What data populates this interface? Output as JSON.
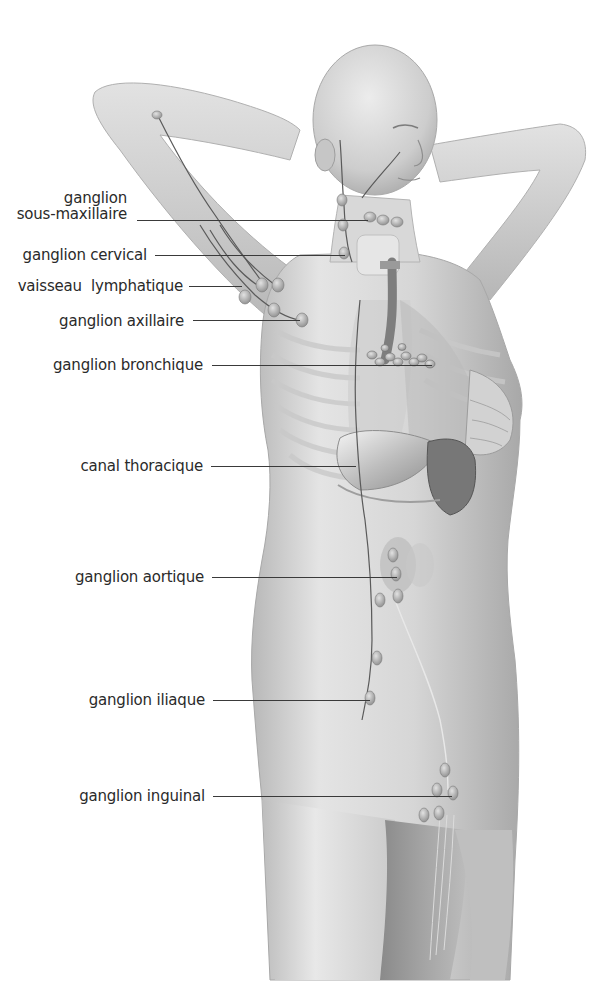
{
  "diagram": {
    "language": "fr",
    "labels": [
      {
        "id": "sous-maxillaire",
        "line1": "ganglion",
        "line2": "sous-maxillaire",
        "text_right": 127,
        "text_top": 190,
        "line_y": 220,
        "line_x1": 137,
        "line_x2": 368
      },
      {
        "id": "cervical",
        "line1": "ganglion cervical",
        "line2": "",
        "text_right": 147,
        "text_top": 247,
        "line_y": 255,
        "line_x1": 155,
        "line_x2": 345
      },
      {
        "id": "vaisseau",
        "line1": "vaisseau  lymphatique",
        "line2": "",
        "text_right": 183,
        "text_top": 278,
        "line_y": 286,
        "line_x1": 189,
        "line_x2": 242
      },
      {
        "id": "axillaire",
        "line1": "ganglion axillaire",
        "line2": "",
        "text_right": 184,
        "text_top": 313,
        "line_y": 320,
        "line_x1": 193,
        "line_x2": 300
      },
      {
        "id": "bronchique",
        "line1": "ganglion bronchique",
        "line2": "",
        "text_right": 203,
        "text_top": 357,
        "line_y": 365,
        "line_x1": 212,
        "line_x2": 432
      },
      {
        "id": "thoracique",
        "line1": "canal thoracique",
        "line2": "",
        "text_right": 203,
        "text_top": 458,
        "line_y": 466,
        "line_x1": 211,
        "line_x2": 356
      },
      {
        "id": "aortique",
        "line1": "ganglion aortique",
        "line2": "",
        "text_right": 204,
        "text_top": 569,
        "line_y": 577,
        "line_x1": 212,
        "line_x2": 397
      },
      {
        "id": "iliaque",
        "line1": "ganglion iliaque",
        "line2": "",
        "text_right": 205,
        "text_top": 692,
        "line_y": 700,
        "line_x1": 213,
        "line_x2": 370
      },
      {
        "id": "inguinal",
        "line1": "ganglion inguinal",
        "line2": "",
        "text_right": 205,
        "text_top": 788,
        "line_y": 796,
        "line_x1": 213,
        "line_x2": 452
      }
    ]
  },
  "colors": {
    "background": "#ffffff",
    "skin_light": "#e6e6e6",
    "skin_mid": "#cfcfcf",
    "skin_dark": "#9a9a9a",
    "vessel": "#5a5a5a",
    "node": "#bdbdbd",
    "label_text": "#2a2a2a",
    "leader_line": "#3a3a3a"
  }
}
